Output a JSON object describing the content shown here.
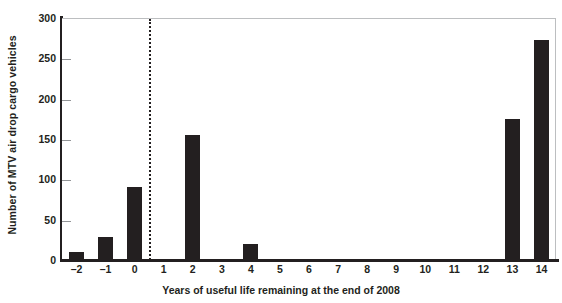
{
  "chart_data": {
    "type": "bar",
    "title": "",
    "xlabel": "Years of useful life remaining at the end of 2008",
    "ylabel": "Number of MTV air drop cargo vehicles",
    "categories": [
      "-2",
      "-1",
      "0",
      "1",
      "2",
      "3",
      "4",
      "5",
      "6",
      "7",
      "8",
      "9",
      "10",
      "11",
      "12",
      "13",
      "14"
    ],
    "values": [
      10,
      28,
      91,
      0,
      155,
      0,
      20,
      0,
      0,
      0,
      0,
      0,
      0,
      0,
      0,
      175,
      273
    ],
    "ylim": [
      0,
      300
    ],
    "yticks": [
      0,
      50,
      100,
      150,
      200,
      250,
      300
    ],
    "ytick_labels": [
      "0",
      "50",
      "100",
      "150",
      "200",
      "250",
      "300"
    ],
    "xlim": [
      -2.5,
      14.5
    ],
    "grid": false,
    "legend": null,
    "bar_color": "#231f20",
    "annotations": [
      {
        "name": "reference-line",
        "type": "vertical-dotted-line",
        "x": 0.5,
        "style": "dotted",
        "color": "#231f20"
      }
    ]
  }
}
